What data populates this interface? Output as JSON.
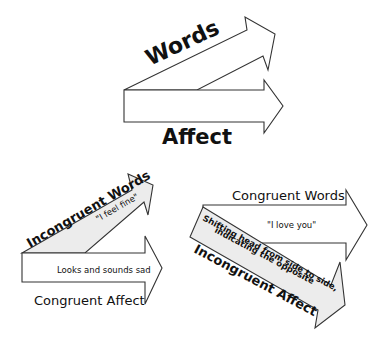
{
  "colors": {
    "stroke": "#333333",
    "fill_white": "#ffffff",
    "fill_gray": "#ececec",
    "text": "#111111"
  },
  "diagram_top": {
    "words_label": "Words",
    "affect_label": "Affect"
  },
  "diagram_left": {
    "words_label": "Incongruent Words",
    "words_quote": "\"I feel fine\"",
    "affect_inner": "Looks and sounds sad",
    "affect_label": "Congruent Affect"
  },
  "diagram_right": {
    "words_label": "Congruent Words",
    "words_quote": "\"I love you\"",
    "affect_inner_line1": "Shifting head from side to side,",
    "affect_inner_line2": "indicating the opposite",
    "affect_label": "Incongruent Affect"
  }
}
